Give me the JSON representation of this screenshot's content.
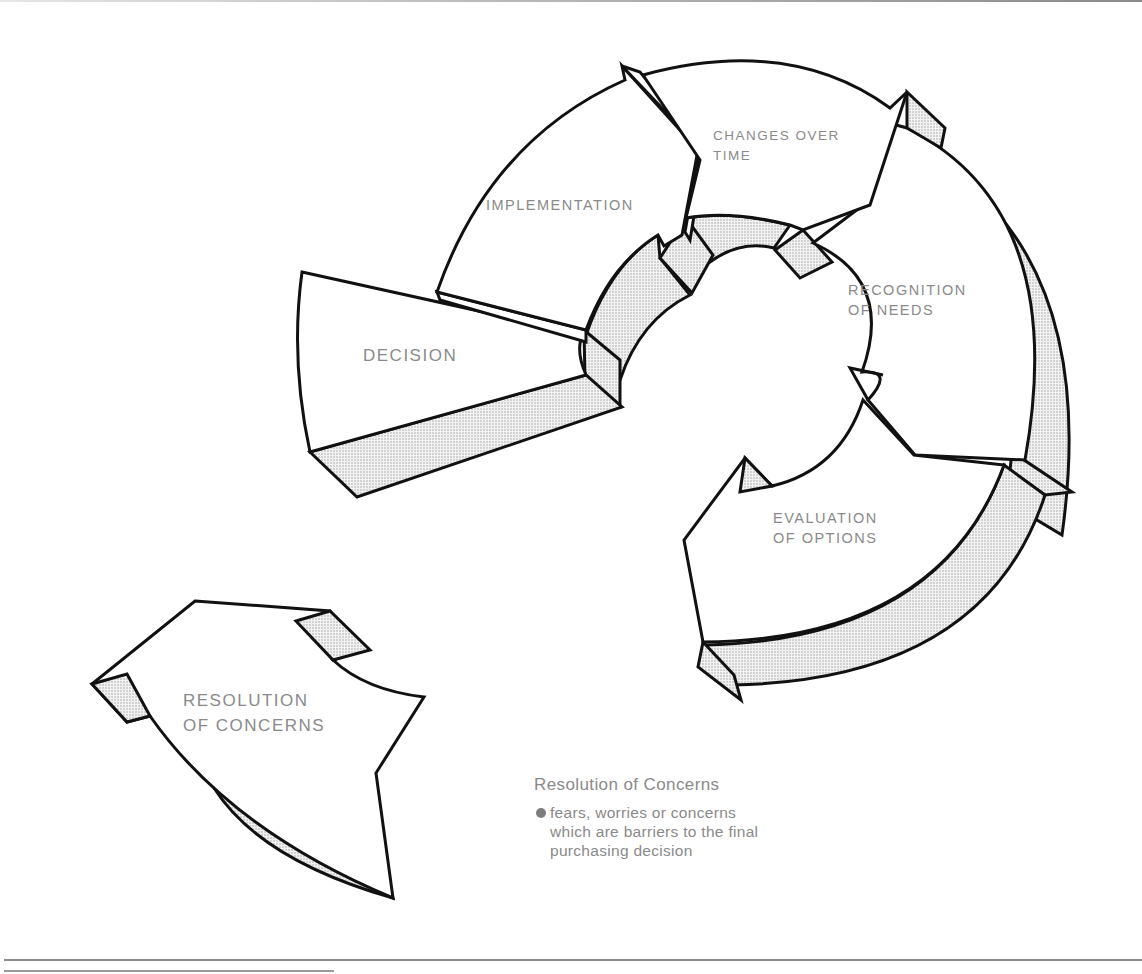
{
  "diagram": {
    "type": "cycle",
    "colors": {
      "outline": "#111111",
      "label_text": "#8a8a8a",
      "shade_fill": "#e4e4e4",
      "face_fill": "#ffffff"
    },
    "segments": [
      {
        "id": "recognition",
        "lines": [
          "RECOGNITION",
          "OF NEEDS"
        ]
      },
      {
        "id": "evaluation",
        "lines": [
          "EVALUATION",
          "OF OPTIONS"
        ]
      },
      {
        "id": "decision",
        "lines": [
          "DECISION"
        ]
      },
      {
        "id": "implementation",
        "lines": [
          "IMPLEMENTATION"
        ]
      },
      {
        "id": "changes",
        "lines": [
          "CHANGES OVER",
          "TIME"
        ]
      }
    ],
    "detached_segment": {
      "id": "resolution",
      "lines": [
        "RESOLUTION",
        "OF CONCERNS"
      ]
    }
  },
  "caption": {
    "title": "Resolution of Concerns",
    "bullets": [
      "fears, worries or concerns which are barriers to the final purchasing decision"
    ]
  }
}
